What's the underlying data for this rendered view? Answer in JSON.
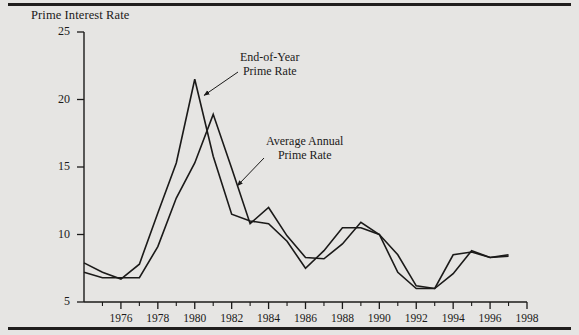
{
  "figure": {
    "background_color": "#e6e5e3",
    "ink_color": "#1b1a19",
    "rule_color": "#201e1d"
  },
  "chart_data": {
    "type": "line",
    "title": "Prime Interest Rate",
    "xlabel": "",
    "ylabel": "Prime Interest Rate",
    "xlim": [
      1974,
      1998
    ],
    "ylim": [
      5,
      25
    ],
    "yticks": [
      5,
      10,
      15,
      20,
      25
    ],
    "ytick_labels": [
      "5",
      "10",
      "15",
      "20",
      "25"
    ],
    "xticks": [
      1976,
      1978,
      1980,
      1982,
      1984,
      1986,
      1988,
      1990,
      1992,
      1994,
      1996,
      1998
    ],
    "xtick_labels": [
      "1976",
      "1978",
      "1980",
      "1982",
      "1984",
      "1986",
      "1988",
      "1990",
      "1992",
      "1994",
      "1996",
      "1998"
    ],
    "minor_xticks": [
      1975,
      1977,
      1979,
      1981,
      1983,
      1985,
      1987,
      1989,
      1991,
      1993,
      1995,
      1997
    ],
    "grid": false,
    "legend": "annotations",
    "x": [
      1974,
      1975,
      1976,
      1977,
      1978,
      1979,
      1980,
      1981,
      1982,
      1983,
      1984,
      1985,
      1986,
      1987,
      1988,
      1989,
      1990,
      1991,
      1992,
      1993,
      1994,
      1995,
      1996,
      1997
    ],
    "series": [
      {
        "name": "End-of-Year Prime Rate",
        "values": [
          7.9,
          7.2,
          6.7,
          7.8,
          11.6,
          15.3,
          21.5,
          15.8,
          11.5,
          11.0,
          10.8,
          9.5,
          7.5,
          8.8,
          10.5,
          10.5,
          10.0,
          7.2,
          6.0,
          6.0,
          8.5,
          8.7,
          8.3,
          8.5
        ],
        "peak_year": 1980,
        "peak_value": 21.5
      },
      {
        "name": "Average Annual Prime Rate",
        "values": [
          7.2,
          6.8,
          6.8,
          6.8,
          9.1,
          12.7,
          15.3,
          18.9,
          14.9,
          10.8,
          12.0,
          9.9,
          8.3,
          8.2,
          9.3,
          10.9,
          10.0,
          8.5,
          6.2,
          6.0,
          7.1,
          8.8,
          8.3,
          8.4
        ],
        "peak_year": 1981,
        "peak_value": 18.9
      }
    ],
    "annotations": [
      {
        "text_lines": [
          "End-of-Year",
          "Prime Rate"
        ],
        "target_year": 1980.5,
        "target_value": 20.3
      },
      {
        "text_lines": [
          "Average Annual",
          "Prime Rate"
        ],
        "target_year": 1982.3,
        "target_value": 13.6
      }
    ]
  }
}
